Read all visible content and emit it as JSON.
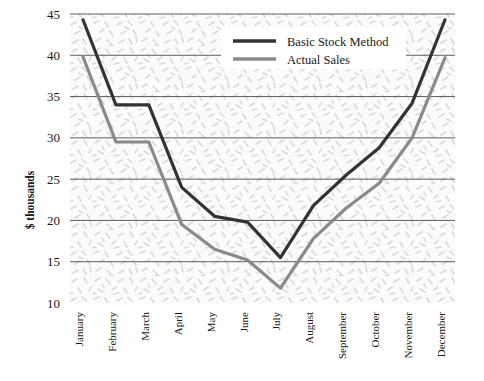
{
  "chart_data": {
    "type": "line",
    "title": "",
    "xlabel": "",
    "ylabel": "$ thousands",
    "ylim": [
      10,
      45
    ],
    "yticks": [
      10,
      15,
      20,
      25,
      30,
      35,
      40,
      45
    ],
    "ytick_labels": [
      "10",
      "15",
      "20",
      "25",
      "30",
      "35",
      "40",
      "45"
    ],
    "grid": "horizontal",
    "legend_position": "top-center",
    "categories": [
      "January",
      "February",
      "March",
      "April",
      "May",
      "June",
      "July",
      "August",
      "September",
      "October",
      "November",
      "December"
    ],
    "series": [
      {
        "name": "Basic Stock Method",
        "color": "#333333",
        "values": [
          44.3,
          34.0,
          34.0,
          24.0,
          20.5,
          19.8,
          15.5,
          21.8,
          25.5,
          28.8,
          34.2,
          44.3
        ]
      },
      {
        "name": "Actual Sales",
        "color": "#8a8a8a",
        "values": [
          39.8,
          29.5,
          29.5,
          19.5,
          16.5,
          15.2,
          11.8,
          17.8,
          21.5,
          24.5,
          30.0,
          39.7
        ]
      }
    ]
  },
  "legend": {
    "entries": [
      {
        "label": "Basic Stock Method",
        "swatch": "legend-swatch-dark"
      },
      {
        "label": "Actual Sales",
        "swatch": "legend-swatch-gray"
      }
    ]
  },
  "axes": {
    "y_title": "$ thousands"
  },
  "colors": {
    "basic_stock_method": "#333333",
    "actual_sales": "#8a8a8a",
    "gridline": "#4d4d4d",
    "plot_background": "#fbfbfb",
    "texture": "#d8dde2"
  }
}
